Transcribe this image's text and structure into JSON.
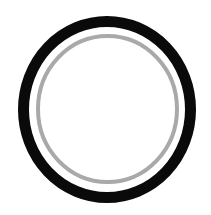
{
  "figure": {
    "background": "#ffffff",
    "outer_ring": {
      "color": "#0a0a0a",
      "cx": 107,
      "cy": 109.5,
      "rx": 83.5,
      "ry": 88,
      "stroke_width": 11
    },
    "inner_ring": {
      "color": "#a9a9a9",
      "cx": 107.5,
      "cy": 109,
      "rx": 69.5,
      "ry": 73,
      "stroke_width": 4
    }
  }
}
